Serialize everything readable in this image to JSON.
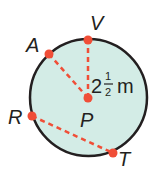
{
  "diagram": {
    "type": "circle",
    "colors": {
      "fill": "#d3ece6",
      "stroke": "#231f20",
      "accent": "#f04e37",
      "text": "#231f20"
    },
    "circle": {
      "cx": 88.5,
      "cy": 97.5,
      "r": 58.5
    },
    "points": [
      {
        "id": "V",
        "label": "V",
        "x": 88,
        "y": 40
      },
      {
        "id": "A",
        "label": "A",
        "x": 49,
        "y": 54
      },
      {
        "id": "P",
        "label": "P",
        "x": 88,
        "y": 98
      },
      {
        "id": "R",
        "label": "R",
        "x": 32,
        "y": 116
      },
      {
        "id": "T",
        "label": "T",
        "x": 113,
        "y": 153
      }
    ],
    "segments": [
      {
        "from": "P",
        "to": "V",
        "style": "dashed",
        "kind": "radius"
      },
      {
        "from": "P",
        "to": "A",
        "style": "dashed",
        "kind": "radius"
      },
      {
        "from": "R",
        "to": "T",
        "style": "dashed",
        "kind": "chord"
      }
    ],
    "measurement": {
      "whole": "2",
      "numerator": "1",
      "denominator": "2",
      "unit": "m",
      "full_text": "2 1/2 m"
    }
  }
}
